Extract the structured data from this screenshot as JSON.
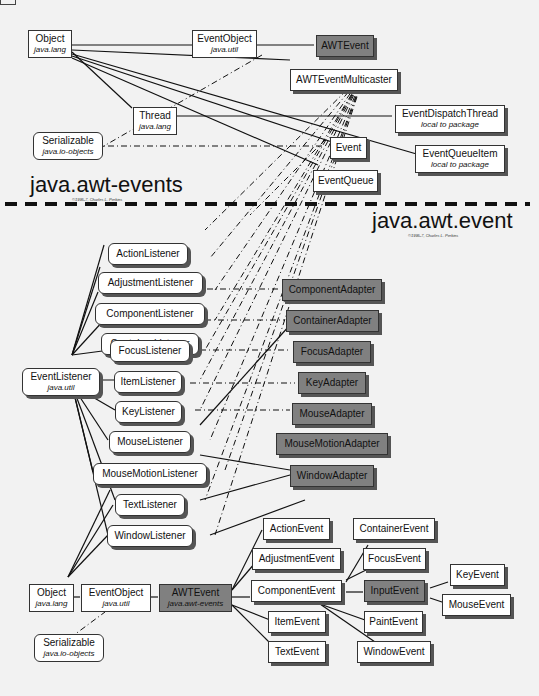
{
  "diagram": {
    "top_section": {
      "title": "java.awt-events",
      "copyright": "©1995-7, Charles L. Perkins",
      "nodes": [
        {
          "id": "object",
          "label": "Object",
          "package": "java.lang"
        },
        {
          "id": "eventobject",
          "label": "EventObject",
          "package": "java.util"
        },
        {
          "id": "awtevent",
          "label": "AWTEvent",
          "package": ""
        },
        {
          "id": "awteventmulticaster",
          "label": "AWTEventMulticaster",
          "package": ""
        },
        {
          "id": "thread",
          "label": "Thread",
          "package": "java.lang"
        },
        {
          "id": "eventdispatchthread",
          "label": "EventDispatchThread",
          "package": "local to package"
        },
        {
          "id": "serializable",
          "label": "Serializable",
          "package": "java.io-objects"
        },
        {
          "id": "event",
          "label": "Event",
          "package": ""
        },
        {
          "id": "eventqueueitem",
          "label": "EventQueueItem",
          "package": "local to package"
        },
        {
          "id": "eventqueue",
          "label": "EventQueue",
          "package": ""
        }
      ]
    },
    "bottom_section": {
      "title": "java.awt.event",
      "copyright": "©1995-7, Charles L. Perkins",
      "eventlistener": {
        "label": "EventListener",
        "package": "java.util"
      },
      "listeners": [
        "ActionListener",
        "AdjustmentListener",
        "ComponentListener",
        "ContainerListener",
        "FocusListener",
        "ItemListener",
        "KeyListener",
        "MouseListener",
        "MouseMotionListener",
        "TextListener",
        "WindowListener"
      ],
      "adapters": [
        "ComponentAdapter",
        "ContainerAdapter",
        "FocusAdapter",
        "KeyAdapter",
        "MouseAdapter",
        "MouseMotionAdapter",
        "WindowAdapter"
      ],
      "object": {
        "label": "Object",
        "package": "java.lang"
      },
      "eventobject": {
        "label": "EventObject",
        "package": "java.util"
      },
      "awtevent": {
        "label": "AWTEvent",
        "package": "java.awt-events"
      },
      "serializable": {
        "label": "Serializable",
        "package": "java.io-objects"
      },
      "events": [
        "ActionEvent",
        "AdjustmentEvent",
        "ComponentEvent",
        "ItemEvent",
        "TextEvent",
        "ContainerEvent",
        "FocusEvent",
        "InputEvent",
        "PaintEvent",
        "WindowEvent",
        "KeyEvent",
        "MouseEvent"
      ]
    },
    "colors": {
      "background": "#f2f2f2",
      "box": "#ffffff",
      "abstract_box": "#808080",
      "line": "#111111"
    }
  }
}
